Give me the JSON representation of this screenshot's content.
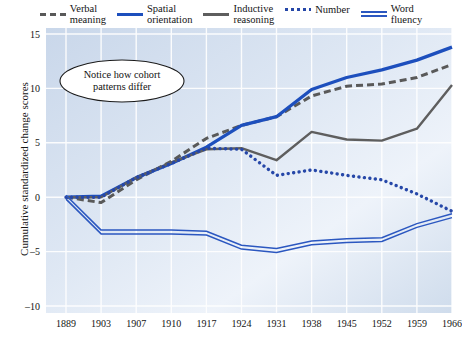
{
  "legend": {
    "entries": [
      {
        "label": "Verbal\nmeaning",
        "style": "dashed",
        "color": "#595959"
      },
      {
        "label": "Spatial\norientation",
        "style": "solid-blue",
        "color": "#1d4fbd"
      },
      {
        "label": "Inductive\nreasoning",
        "style": "solid-gray",
        "color": "#5e5e5e"
      },
      {
        "label": "Number",
        "style": "dotted",
        "color": "#2647a8"
      },
      {
        "label": "Word\nfluency",
        "style": "double",
        "color": "#2b57c0"
      }
    ]
  },
  "annotation": {
    "line1": "Notice how cohort",
    "line2": "patterns differ"
  },
  "axes": {
    "ylabel": "Cumulative standardized change scores",
    "xlabel": "Cohort",
    "yticks": [
      "15",
      "10",
      "5",
      "0",
      "–5",
      "–10"
    ],
    "xticks": [
      "1889",
      "1903",
      "1907",
      "1910",
      "1917",
      "1924",
      "1931",
      "1938",
      "1945",
      "1952",
      "1959",
      "1966"
    ]
  },
  "chart_data": {
    "type": "line",
    "title": "",
    "xlabel": "Cohort",
    "ylabel": "Cumulative standardized change scores",
    "categories": [
      "1889",
      "1903",
      "1907",
      "1910",
      "1917",
      "1924",
      "1931",
      "1938",
      "1945",
      "1952",
      "1959",
      "1966"
    ],
    "ylim": [
      -10,
      15
    ],
    "yticks": [
      -10,
      -5,
      0,
      5,
      10,
      15
    ],
    "grid": true,
    "legend_position": "top",
    "series": [
      {
        "name": "Verbal meaning",
        "style": "dashed",
        "color": "#595959",
        "values": [
          0,
          -0.5,
          1.6,
          3.3,
          5.4,
          6.6,
          7.4,
          9.3,
          10.2,
          10.4,
          11.0,
          12.2
        ]
      },
      {
        "name": "Spatial orientation",
        "style": "solid",
        "color": "#1d4fbd",
        "values": [
          0,
          0.1,
          1.8,
          3.1,
          4.6,
          6.6,
          7.4,
          9.9,
          11.0,
          11.7,
          12.6,
          13.8
        ]
      },
      {
        "name": "Inductive reasoning",
        "style": "solid",
        "color": "#5e5e5e",
        "values": [
          0,
          0.0,
          1.8,
          3.2,
          4.4,
          4.5,
          3.4,
          6.0,
          5.3,
          5.2,
          6.3,
          10.3
        ]
      },
      {
        "name": "Number",
        "style": "dotted",
        "color": "#2647a8",
        "values": [
          0,
          0.0,
          1.8,
          3.1,
          4.5,
          4.4,
          2.0,
          2.5,
          2.0,
          1.6,
          0.3,
          -1.3
        ]
      },
      {
        "name": "Word fluency",
        "style": "double",
        "color": "#2b57c0",
        "values": [
          0,
          -3.2,
          -3.2,
          -3.2,
          -3.3,
          -4.6,
          -4.9,
          -4.2,
          -4.0,
          -3.9,
          -2.6,
          -1.7
        ]
      }
    ],
    "annotations": [
      {
        "text": "Notice how cohort patterns differ",
        "shape": "ellipse",
        "x": "1889-1907",
        "y": 11
      }
    ]
  }
}
